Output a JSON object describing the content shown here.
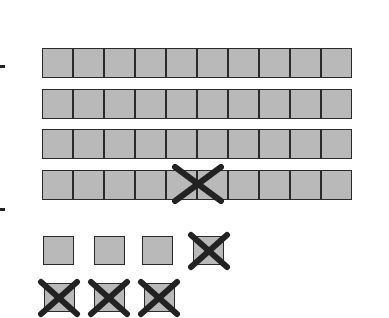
{
  "diagram": {
    "type": "base-ten-blocks",
    "colors": {
      "block_fill": "#b9b9b9",
      "outline": "#2a2a2a",
      "cross": "#222222"
    },
    "tens_rods": [
      {
        "cells": 10,
        "crossed_at": null
      },
      {
        "cells": 10,
        "crossed_at": null
      },
      {
        "cells": 10,
        "crossed_at": null
      },
      {
        "cells": 10,
        "crossed_at": "between cell 5 and 6"
      }
    ],
    "ones": {
      "row1": [
        {
          "crossed": false
        },
        {
          "crossed": false
        },
        {
          "crossed": false
        },
        {
          "crossed": true
        }
      ],
      "row2": [
        {
          "crossed": true
        },
        {
          "crossed": true
        },
        {
          "crossed": true
        }
      ]
    },
    "left_marks": 2
  }
}
